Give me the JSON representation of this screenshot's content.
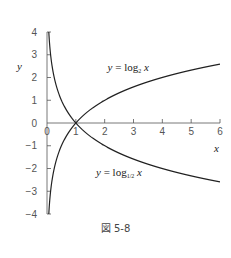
{
  "chart_data": {
    "type": "line",
    "title": "",
    "caption": "図 5-8",
    "xlabel": "x",
    "ylabel": "y",
    "xlim": [
      0,
      6
    ],
    "ylim": [
      -4,
      4
    ],
    "xticks": [
      0,
      1,
      2,
      3,
      4,
      5,
      6
    ],
    "xtick_labels": [
      "0",
      "1",
      "2",
      "3",
      "4",
      "5",
      "6"
    ],
    "yticks": [
      4,
      3,
      2,
      1,
      0,
      -1,
      -2,
      -3,
      -4
    ],
    "ytick_labels": [
      "4",
      "3",
      "2",
      "1",
      "0",
      "-1",
      "-2",
      "-3",
      "-4"
    ],
    "grid": false,
    "series": [
      {
        "name": "y = log_2 x",
        "function": "log2(x)",
        "base": 2,
        "x": [
          0.0625,
          0.125,
          0.25,
          0.5,
          1,
          2,
          3,
          4,
          5,
          6
        ],
        "values": [
          -4,
          -3,
          -2,
          -1,
          0,
          1,
          1.585,
          2,
          2.322,
          2.585
        ],
        "color": "#222222"
      },
      {
        "name": "y = log_{1/2} x",
        "function": "log_{1/2}(x)",
        "base": 0.5,
        "x": [
          0.0625,
          0.125,
          0.25,
          0.5,
          1,
          2,
          3,
          4,
          5,
          6
        ],
        "values": [
          4,
          3,
          2,
          1,
          0,
          -1,
          -1.585,
          -2,
          -2.322,
          -2.585
        ],
        "color": "#222222"
      }
    ],
    "annotations": [
      {
        "text_prefix": "y",
        "text_eq": " = log",
        "sub": "2",
        "text_var": " x",
        "series": 0,
        "anchor_x": 2.1,
        "anchor_y": 2.3
      },
      {
        "text_prefix": "y",
        "text_eq": " = log",
        "sub": "1/2",
        "text_var": " x",
        "series": 1,
        "anchor_x": 1.7,
        "anchor_y": -2.35
      }
    ]
  }
}
